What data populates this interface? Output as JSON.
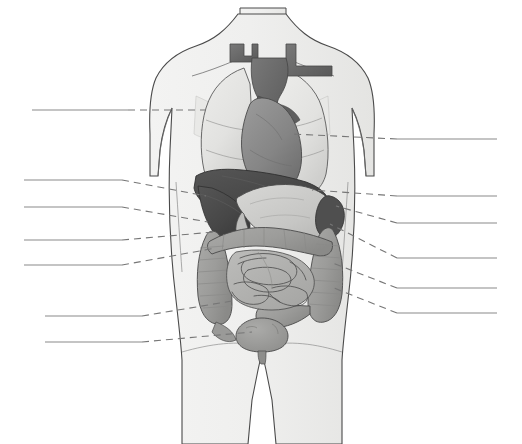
{
  "figure": {
    "kind": "anatomical-illustration",
    "view": "anterior",
    "canvas": {
      "width": 522,
      "height": 444
    },
    "background_color": "#ffffff"
  },
  "palette": {
    "outline": "#4a4a4a",
    "body_fill": "#f0f0ef",
    "body_fill_shadow": "#e3e3e1",
    "lung_fill": "#e8e8e6",
    "lung_shadow": "#d2d2d0",
    "heart_fill": "#8a8a8a",
    "heart_shadow": "#6f6f6f",
    "vessel_fill": "#6e6e6e",
    "vessel_dark": "#5a5a5a",
    "liver_fill": "#4c4c4c",
    "liver_shadow": "#3d3d3d",
    "stomach_fill": "#c9c9c7",
    "spleen_fill": "#4f4f4f",
    "colon_fill": "#9f9f9d",
    "colon_shadow": "#8c8c8a",
    "small_intestine_fill": "#b0b0ae",
    "bladder_fill": "#9a9a98",
    "leader_line": "#767676",
    "label_line": "#8a8a8a"
  },
  "labels": {
    "left_count": 6,
    "right_count": 6,
    "total_count": 12,
    "all_blank": true,
    "left": [
      {
        "id": "left-1",
        "text": "",
        "line": {
          "x1": 32,
          "y1": 110,
          "x2": 128,
          "y2": 110
        },
        "leader": {
          "points": "128,110 206,110"
        }
      },
      {
        "id": "left-2",
        "text": "",
        "line": {
          "x1": 24,
          "y1": 180,
          "x2": 122,
          "y2": 180
        },
        "leader": {
          "points": "122,180 206,196"
        }
      },
      {
        "id": "left-3",
        "text": "",
        "line": {
          "x1": 24,
          "y1": 207,
          "x2": 122,
          "y2": 207
        },
        "leader": {
          "points": "122,207 208,222"
        }
      },
      {
        "id": "left-4",
        "text": "",
        "line": {
          "x1": 24,
          "y1": 240,
          "x2": 122,
          "y2": 240
        },
        "leader": {
          "points": "122,240 214,232"
        }
      },
      {
        "id": "left-5",
        "text": "",
        "line": {
          "x1": 24,
          "y1": 265,
          "x2": 122,
          "y2": 265
        },
        "leader": {
          "points": "122,265 216,248"
        }
      },
      {
        "id": "left-6",
        "text": "",
        "line": {
          "x1": 45,
          "y1": 316,
          "x2": 142,
          "y2": 316
        },
        "leader": {
          "points": "142,316 238,300"
        }
      },
      {
        "id": "left-7",
        "text": "",
        "line": {
          "x1": 45,
          "y1": 342,
          "x2": 142,
          "y2": 342
        },
        "leader": {
          "points": "142,342 250,330"
        }
      }
    ],
    "right": [
      {
        "id": "right-1",
        "text": "",
        "line": {
          "x1": 397,
          "y1": 139,
          "x2": 497,
          "y2": 139
        },
        "leader": {
          "points": "397,139 292,134"
        }
      },
      {
        "id": "right-2",
        "text": "",
        "line": {
          "x1": 397,
          "y1": 196,
          "x2": 497,
          "y2": 196
        },
        "leader": {
          "points": "397,196 312,190"
        }
      },
      {
        "id": "right-3",
        "text": "",
        "line": {
          "x1": 397,
          "y1": 223,
          "x2": 497,
          "y2": 223
        },
        "leader": {
          "points": "397,223 336,206"
        }
      },
      {
        "id": "right-4",
        "text": "",
        "line": {
          "x1": 397,
          "y1": 258,
          "x2": 497,
          "y2": 258
        },
        "leader": {
          "points": "397,258 330,224"
        }
      },
      {
        "id": "right-5",
        "text": "",
        "line": {
          "x1": 397,
          "y1": 288,
          "x2": 497,
          "y2": 288
        },
        "leader": {
          "points": "397,288 330,262"
        }
      },
      {
        "id": "right-6",
        "text": "",
        "line": {
          "x1": 397,
          "y1": 313,
          "x2": 497,
          "y2": 313
        },
        "leader": {
          "points": "397,313 334,288"
        }
      }
    ]
  },
  "organs": [
    {
      "name": "right-lung",
      "tone": "light"
    },
    {
      "name": "left-lung",
      "tone": "light"
    },
    {
      "name": "heart",
      "tone": "medium"
    },
    {
      "name": "aorta-great-vessels",
      "tone": "dark"
    },
    {
      "name": "liver",
      "tone": "darkest"
    },
    {
      "name": "stomach",
      "tone": "light"
    },
    {
      "name": "spleen",
      "tone": "darkest"
    },
    {
      "name": "large-intestine",
      "tone": "medium"
    },
    {
      "name": "small-intestine",
      "tone": "medium"
    },
    {
      "name": "urinary-bladder",
      "tone": "medium"
    }
  ]
}
